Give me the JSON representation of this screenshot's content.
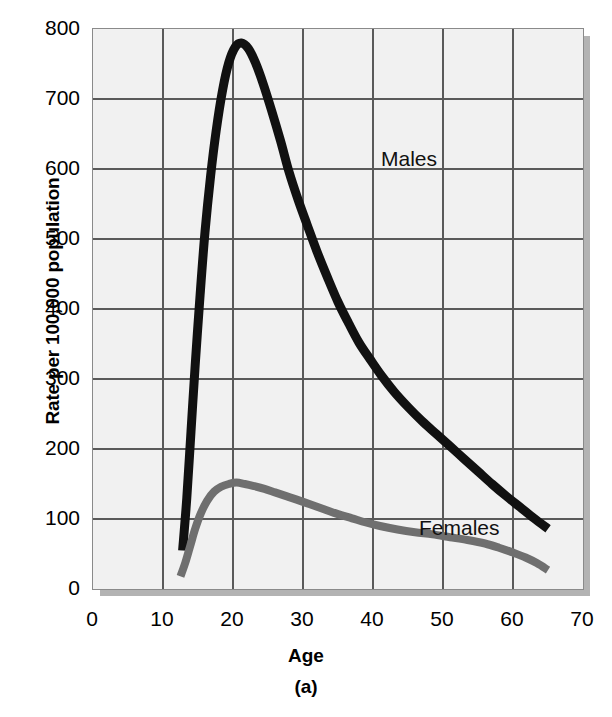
{
  "chart_data": {
    "type": "line",
    "title": "",
    "xlabel": "Age",
    "ylabel": "Rate per 100,000 population",
    "caption": "(a)",
    "xlim": [
      0,
      70
    ],
    "ylim": [
      0,
      800
    ],
    "x_ticks": [
      0,
      10,
      20,
      30,
      40,
      50,
      60,
      70
    ],
    "y_ticks": [
      0,
      100,
      200,
      300,
      400,
      500,
      600,
      700,
      800
    ],
    "x_tick_labels": [
      "0",
      "10",
      "20",
      "30",
      "40",
      "50",
      "60",
      "70"
    ],
    "y_tick_labels": [
      "0",
      "100",
      "200",
      "300",
      "400",
      "500",
      "600",
      "700",
      "800"
    ],
    "grid": true,
    "legend_position": "inline-annotations",
    "series": [
      {
        "name": "Males",
        "color": "#111111",
        "label_x": 28.5,
        "label_y": 672,
        "points": [
          [
            12.8,
            55
          ],
          [
            13.4,
            130
          ],
          [
            14.0,
            225
          ],
          [
            14.6,
            320
          ],
          [
            15.3,
            420
          ],
          [
            16.0,
            510
          ],
          [
            16.8,
            590
          ],
          [
            17.6,
            655
          ],
          [
            18.5,
            712
          ],
          [
            19.4,
            752
          ],
          [
            20.3,
            774
          ],
          [
            21.2,
            780
          ],
          [
            22.2,
            772
          ],
          [
            23.2,
            752
          ],
          [
            24.3,
            722
          ],
          [
            25.5,
            684
          ],
          [
            26.8,
            640
          ],
          [
            28.0,
            596
          ],
          [
            29.3,
            556
          ],
          [
            30.6,
            520
          ],
          [
            32.0,
            482
          ],
          [
            33.5,
            445
          ],
          [
            35.0,
            410
          ],
          [
            36.5,
            380
          ],
          [
            38.0,
            352
          ],
          [
            39.6,
            328
          ],
          [
            41.2,
            305
          ],
          [
            43.0,
            282
          ],
          [
            45.0,
            260
          ],
          [
            47.0,
            240
          ],
          [
            49.0,
            222
          ],
          [
            51.0,
            204
          ],
          [
            53.0,
            186
          ],
          [
            55.0,
            168
          ],
          [
            57.0,
            150
          ],
          [
            59.0,
            133
          ],
          [
            61.0,
            117
          ],
          [
            63.0,
            101
          ],
          [
            65.0,
            86
          ]
        ]
      },
      {
        "name": "Females",
        "color": "#6f6f6f",
        "label_x": 33.5,
        "label_y": 145,
        "points": [
          [
            12.5,
            18
          ],
          [
            13.2,
            38
          ],
          [
            13.9,
            62
          ],
          [
            14.6,
            86
          ],
          [
            15.4,
            108
          ],
          [
            16.3,
            126
          ],
          [
            17.3,
            139
          ],
          [
            18.3,
            146
          ],
          [
            19.4,
            150
          ],
          [
            20.5,
            152
          ],
          [
            21.7,
            150
          ],
          [
            23.0,
            147
          ],
          [
            24.5,
            143
          ],
          [
            26.0,
            138
          ],
          [
            27.5,
            133
          ],
          [
            29.0,
            128
          ],
          [
            31.0,
            121
          ],
          [
            33.0,
            114
          ],
          [
            35.0,
            107
          ],
          [
            37.0,
            101
          ],
          [
            39.0,
            95
          ],
          [
            41.0,
            90
          ],
          [
            43.5,
            85
          ],
          [
            46.0,
            81
          ],
          [
            48.5,
            78
          ],
          [
            51.0,
            74
          ],
          [
            53.5,
            70
          ],
          [
            56.0,
            65
          ],
          [
            58.0,
            59
          ],
          [
            60.0,
            52
          ],
          [
            61.8,
            45
          ],
          [
            63.4,
            37
          ],
          [
            65.0,
            27
          ]
        ]
      }
    ]
  },
  "axes": {
    "x_title": "Age",
    "y_title": "Rate per 100,000 population"
  },
  "caption": "(a)",
  "colors": {
    "plot_background": "#f1f1f1",
    "plot_border": "#8a8a8a",
    "gridline": "#5a5a5a",
    "shadow": "#b3b3b3",
    "males": "#111111",
    "females": "#6f6f6f",
    "text": "#000000"
  }
}
